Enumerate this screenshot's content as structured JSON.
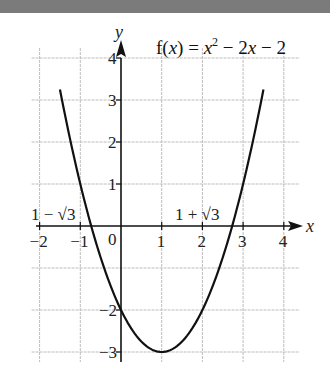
{
  "chart_data": {
    "type": "line",
    "function": "x^2 - 2x - 2",
    "xlabel": "x",
    "ylabel": "y",
    "xlim": [
      -2,
      4
    ],
    "ylim": [
      -3,
      4
    ],
    "grid": true,
    "x_ticks": [
      -2,
      -1,
      0,
      1,
      2,
      3,
      4
    ],
    "x_tick_labels": [
      "−2",
      "−1",
      "0",
      "1",
      "2",
      "3",
      "4"
    ],
    "y_ticks": [
      -3,
      -2,
      1,
      2,
      3,
      4
    ],
    "y_tick_labels": [
      "−3",
      "−2",
      "1",
      "2",
      "3",
      "4"
    ],
    "series": [
      {
        "name": "f(x) = x² − 2x − 2",
        "x": [
          -1.45,
          -1,
          -0.732,
          0,
          0.5,
          1,
          1.5,
          2,
          2.732,
          3,
          3.45
        ],
        "y": [
          4,
          1,
          0,
          -2,
          -2.75,
          -3,
          -2.75,
          -2,
          0,
          1,
          4
        ]
      }
    ],
    "annotations": [
      {
        "text": "1 − √3",
        "x": -0.732,
        "y": 0
      },
      {
        "text": "1 + √3",
        "x": 2.732,
        "y": 0
      }
    ],
    "vertex": {
      "x": 1,
      "y": -3
    },
    "y_intercept": -2
  },
  "labels": {
    "title_prefix": "f(",
    "title_var": "x",
    "title_mid": ") = ",
    "title_x2": "x",
    "title_exp": "2",
    "title_rest": " − 2",
    "title_x": "x",
    "title_end": " − 2",
    "x_axis": "x",
    "y_axis": "y",
    "origin": "0",
    "root_left": "1 − √3",
    "root_right": "1 + √3"
  }
}
